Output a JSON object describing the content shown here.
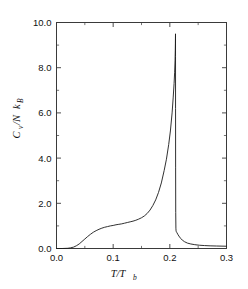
{
  "figure": {
    "background_color": "#ffffff",
    "frame_color": "#3a3a3a",
    "curve_color": "#1a1a1a"
  },
  "axis_titles": {
    "y_main": "C",
    "y_sub1": "v",
    "y_mid": "/N",
    "y_k": "k",
    "y_sub2": "B",
    "x_main": "T/T",
    "x_sub": "b"
  },
  "chart_data": {
    "type": "line",
    "title": "",
    "xlabel": "T/T_b",
    "ylabel": "C_v/Nk_B",
    "xlim": [
      0.0,
      0.3
    ],
    "ylim": [
      0.0,
      10.0
    ],
    "xticks": [
      0.0,
      0.1,
      0.2,
      0.3
    ],
    "xtick_labels": [
      "0.0",
      "0.1",
      "0.2",
      "0.3"
    ],
    "yticks": [
      0.0,
      2.0,
      4.0,
      6.0,
      8.0,
      10.0
    ],
    "ytick_labels": [
      "0.0",
      "2.0",
      "4.0",
      "6.0",
      "8.0",
      "10.0"
    ],
    "xminor_step": 0.05,
    "yminor_step": 1.0,
    "grid": false,
    "legend": false,
    "tick_direction": "in",
    "frame": "box",
    "series": [
      {
        "name": "heat capacity",
        "x": [
          0.0,
          0.01,
          0.02,
          0.025,
          0.03,
          0.035,
          0.04,
          0.045,
          0.05,
          0.055,
          0.06,
          0.065,
          0.07,
          0.075,
          0.08,
          0.085,
          0.09,
          0.095,
          0.1,
          0.105,
          0.11,
          0.115,
          0.12,
          0.125,
          0.13,
          0.135,
          0.14,
          0.145,
          0.15,
          0.155,
          0.16,
          0.165,
          0.17,
          0.175,
          0.18,
          0.185,
          0.19,
          0.194,
          0.198,
          0.201,
          0.204,
          0.206,
          0.2075,
          0.2085,
          0.2092,
          0.2096,
          0.2098,
          0.2099,
          0.20995,
          0.21,
          0.21005,
          0.2101,
          0.2102,
          0.2104,
          0.2107,
          0.211,
          0.2115,
          0.2125,
          0.214,
          0.216,
          0.219,
          0.222,
          0.226,
          0.231,
          0.237,
          0.244,
          0.252,
          0.261,
          0.271,
          0.282,
          0.292,
          0.3
        ],
        "y": [
          0.0,
          0.0,
          0.01,
          0.03,
          0.06,
          0.12,
          0.2,
          0.31,
          0.42,
          0.53,
          0.63,
          0.72,
          0.79,
          0.85,
          0.9,
          0.94,
          0.97,
          1.0,
          1.02,
          1.05,
          1.07,
          1.09,
          1.12,
          1.15,
          1.18,
          1.21,
          1.25,
          1.3,
          1.36,
          1.44,
          1.55,
          1.7,
          1.9,
          2.15,
          2.48,
          2.9,
          3.45,
          3.95,
          4.6,
          5.2,
          6.0,
          6.7,
          7.3,
          7.8,
          8.3,
          8.75,
          9.05,
          9.3,
          9.42,
          9.5,
          8.5,
          6.2,
          3.6,
          1.6,
          0.9,
          0.78,
          0.74,
          0.7,
          0.63,
          0.55,
          0.45,
          0.37,
          0.3,
          0.24,
          0.2,
          0.17,
          0.145,
          0.13,
          0.118,
          0.11,
          0.105,
          0.1
        ]
      }
    ],
    "annotations": {
      "peak_value": 9.5,
      "peak_x": 0.21,
      "shoulder_value": 1.0,
      "shoulder_x": 0.095,
      "onset_x": 0.025,
      "endpoint_value": 0.1
    }
  }
}
